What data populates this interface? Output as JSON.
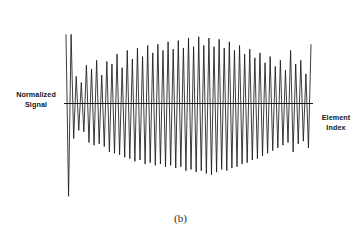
{
  "figure": {
    "caption": "(b)",
    "background_color": "#ffffff",
    "ink_color": "#1a1a1a"
  },
  "labels": {
    "y_axis": "Normalized\nSignal",
    "x_axis": "Element\nIndex"
  },
  "chart_data": {
    "type": "line",
    "title": "",
    "subtitle": "",
    "xlabel": "Element Index",
    "ylabel": "Normalized Signal",
    "grid": false,
    "legend": null,
    "axis_style": "single horizontal zero-axis line, no ticks, no tick labels, no box frame",
    "xlim": [
      0,
      96
    ],
    "ylim": [
      -1.45,
      1.45
    ],
    "zero_line_y": 0,
    "x": [
      0,
      1,
      2,
      3,
      4,
      5,
      6,
      7,
      8,
      9,
      10,
      11,
      12,
      13,
      14,
      15,
      16,
      17,
      18,
      19,
      20,
      21,
      22,
      23,
      24,
      25,
      26,
      27,
      28,
      29,
      30,
      31,
      32,
      33,
      34,
      35,
      36,
      37,
      38,
      39,
      40,
      41,
      42,
      43,
      44,
      45,
      46,
      47,
      48,
      49,
      50,
      51,
      52,
      53,
      54,
      55,
      56,
      57,
      58,
      59,
      60,
      61,
      62,
      63,
      64,
      65,
      66,
      67,
      68,
      69,
      70,
      71,
      72,
      73,
      74,
      75,
      76,
      77,
      78,
      79,
      80,
      81,
      82,
      83,
      84,
      85,
      86,
      87,
      88,
      89,
      90,
      91,
      92,
      93,
      94,
      95,
      96
    ],
    "values": [
      1.12,
      -1.38,
      1.12,
      -0.52,
      0.44,
      -0.4,
      0.34,
      -0.42,
      0.62,
      -0.58,
      0.56,
      -0.62,
      0.7,
      -0.6,
      0.46,
      -0.64,
      0.68,
      -0.72,
      0.64,
      -0.74,
      0.8,
      -0.76,
      0.58,
      -0.8,
      0.86,
      -0.82,
      0.72,
      -0.86,
      0.9,
      -0.84,
      0.76,
      -0.9,
      0.94,
      -0.88,
      0.82,
      -0.92,
      0.96,
      -0.9,
      0.86,
      -0.94,
      1.0,
      -0.92,
      0.88,
      -0.96,
      1.02,
      -0.94,
      0.9,
      -1.0,
      1.06,
      -0.98,
      0.92,
      -1.02,
      1.08,
      -1.0,
      0.94,
      -1.04,
      1.06,
      -1.06,
      0.92,
      -1.02,
      1.04,
      -0.98,
      0.9,
      -1.0,
      1.0,
      -0.96,
      0.86,
      -0.94,
      0.94,
      -0.9,
      0.8,
      -0.88,
      0.88,
      -0.84,
      0.74,
      -0.82,
      0.82,
      -0.78,
      0.66,
      -0.74,
      0.76,
      -0.7,
      0.6,
      -0.66,
      0.7,
      -0.62,
      0.54,
      -0.58,
      0.86,
      -0.72,
      0.64,
      -0.6,
      0.7,
      -0.56,
      0.48,
      -0.66,
      0.96
    ]
  }
}
